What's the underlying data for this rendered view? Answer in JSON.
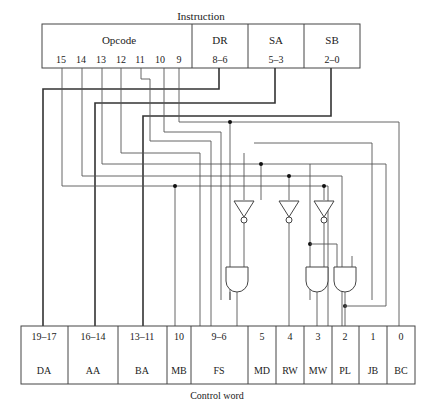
{
  "diagram": {
    "instruction_title": "Instruction",
    "instruction_fields": [
      {
        "name": "Opcode",
        "bits": ""
      },
      {
        "name": "DR",
        "bits": "8–6"
      },
      {
        "name": "SA",
        "bits": "5–3"
      },
      {
        "name": "SB",
        "bits": "2–0"
      }
    ],
    "opcode_bits": [
      "15",
      "14",
      "13",
      "12",
      "11",
      "10",
      "9"
    ],
    "control_word_title": "Control word",
    "control_fields": [
      {
        "name": "DA",
        "bits": "19–17"
      },
      {
        "name": "AA",
        "bits": "16–14"
      },
      {
        "name": "BA",
        "bits": "13–11"
      },
      {
        "name": "MB",
        "bits": "10"
      },
      {
        "name": "FS",
        "bits": "9–6"
      },
      {
        "name": "MD",
        "bits": "5"
      },
      {
        "name": "RW",
        "bits": "4"
      },
      {
        "name": "MW",
        "bits": "3"
      },
      {
        "name": "PL",
        "bits": "2"
      },
      {
        "name": "JB",
        "bits": "1"
      },
      {
        "name": "BC",
        "bits": "0"
      }
    ],
    "gates": {
      "inverters": 3,
      "and_gates": 3
    }
  }
}
